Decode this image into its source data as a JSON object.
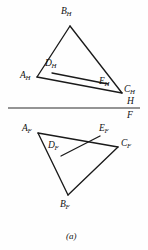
{
  "figure": {
    "caption": "(a)",
    "ink_color": "#1a1a1a",
    "background_color": "#fefefe",
    "width": 148,
    "height": 250
  },
  "fold_line": {
    "name": "H/F reference line",
    "upper_label": "H",
    "lower_label": "F",
    "x1": 8,
    "y1": 108,
    "x2": 140,
    "y2": 108
  },
  "top_view": {
    "name": "horizontal projection",
    "points": {
      "A": {
        "label": "A",
        "sub": "H",
        "x": 37,
        "y": 77,
        "label_x": 20,
        "label_y": 71
      },
      "B": {
        "label": "B",
        "sub": "H",
        "x": 70,
        "y": 26,
        "label_x": 61,
        "label_y": 7
      },
      "C": {
        "label": "C",
        "sub": "H",
        "x": 122,
        "y": 93,
        "label_x": 124,
        "label_y": 85
      },
      "D": {
        "label": "D",
        "sub": "H",
        "x": 52,
        "y": 73,
        "label_x": 45,
        "label_y": 59
      },
      "E": {
        "label": "E",
        "sub": "H",
        "x": 108,
        "y": 84,
        "label_x": 99,
        "label_y": 77
      }
    },
    "segments": [
      {
        "from": "A",
        "to": "B"
      },
      {
        "from": "B",
        "to": "C"
      },
      {
        "from": "A",
        "to": "C"
      },
      {
        "from": "D",
        "to": "E"
      }
    ]
  },
  "front_view": {
    "name": "frontal projection",
    "points": {
      "A": {
        "label": "A",
        "sub": "F",
        "x": 38,
        "y": 133,
        "label_x": 22,
        "label_y": 124
      },
      "B": {
        "label": "B",
        "sub": "F",
        "x": 68,
        "y": 195,
        "label_x": 60,
        "label_y": 200
      },
      "C": {
        "label": "C",
        "sub": "F",
        "x": 118,
        "y": 147,
        "label_x": 121,
        "label_y": 139
      },
      "D": {
        "label": "D",
        "sub": "F",
        "x": 61,
        "y": 156,
        "label_x": 48,
        "label_y": 141
      },
      "E": {
        "label": "E",
        "sub": "F",
        "x": 100,
        "y": 136,
        "label_x": 99,
        "label_y": 124
      }
    },
    "segments": [
      {
        "from": "A",
        "to": "B"
      },
      {
        "from": "B",
        "to": "C"
      },
      {
        "from": "A",
        "to": "C"
      },
      {
        "from": "D",
        "to": "E"
      }
    ]
  }
}
